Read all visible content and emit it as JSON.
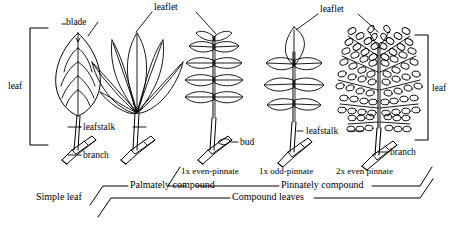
{
  "figure": {
    "line_color": "#000000",
    "background_color": "#ffffff"
  },
  "part_labels": {
    "blade": "blade",
    "leaflet_left": "leaflet",
    "leaflet_right": "leaflet",
    "leaf_left": "leaf",
    "leaf_right": "leaf",
    "leafstalk_left": "leafstalk",
    "leafstalk_right": "leafstalk",
    "branch_left": "branch",
    "branch_right": "branch",
    "bud": "bud"
  },
  "specimen_captions": {
    "even_pinnate": "1x even-pinnate",
    "odd_pinnate": "1x odd-pinnate",
    "bipinnate": "2x even pinnate"
  },
  "category_labels": {
    "simple_leaf": "Simple leaf",
    "palmately_compound": "Palmately compound",
    "pinnately_compound": "Pinnately compound",
    "compound_leaves": "Compound leaves"
  },
  "specimens": [
    {
      "name": "simple-leaf",
      "type": "simple",
      "category": "Simple leaf"
    },
    {
      "name": "palmately-compound-leaf",
      "type": "palmate",
      "category": "Palmately compound"
    },
    {
      "name": "even-pinnate-leaf",
      "type": "even-pinnate",
      "category": "Pinnately compound"
    },
    {
      "name": "odd-pinnate-leaf",
      "type": "odd-pinnate",
      "category": "Pinnately compound"
    },
    {
      "name": "bipinnate-leaf",
      "type": "2x-even-pinnate",
      "category": "Pinnately compound"
    }
  ]
}
